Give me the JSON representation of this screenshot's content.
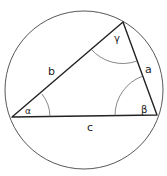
{
  "diagram": {
    "colors": {
      "stroke": "#222222",
      "thin": "#444444",
      "background": "#ffffff"
    },
    "circle": {
      "cx": 84,
      "cy": 90,
      "r": 79
    },
    "vertices": {
      "A": {
        "x": 12,
        "y": 117
      },
      "B": {
        "x": 157,
        "y": 115
      },
      "C": {
        "x": 123,
        "y": 22
      }
    },
    "sides": {
      "a": {
        "label": "a",
        "x": 145,
        "y": 73
      },
      "b": {
        "label": "b",
        "x": 51,
        "y": 74
      },
      "c": {
        "label": "c",
        "x": 90,
        "y": 132
      }
    },
    "angles": {
      "alpha": {
        "label": "α",
        "x": 26,
        "y": 114
      },
      "beta": {
        "label": "β",
        "x": 145,
        "y": 112
      },
      "gamma": {
        "label": "γ",
        "x": 118,
        "y": 42
      }
    }
  }
}
